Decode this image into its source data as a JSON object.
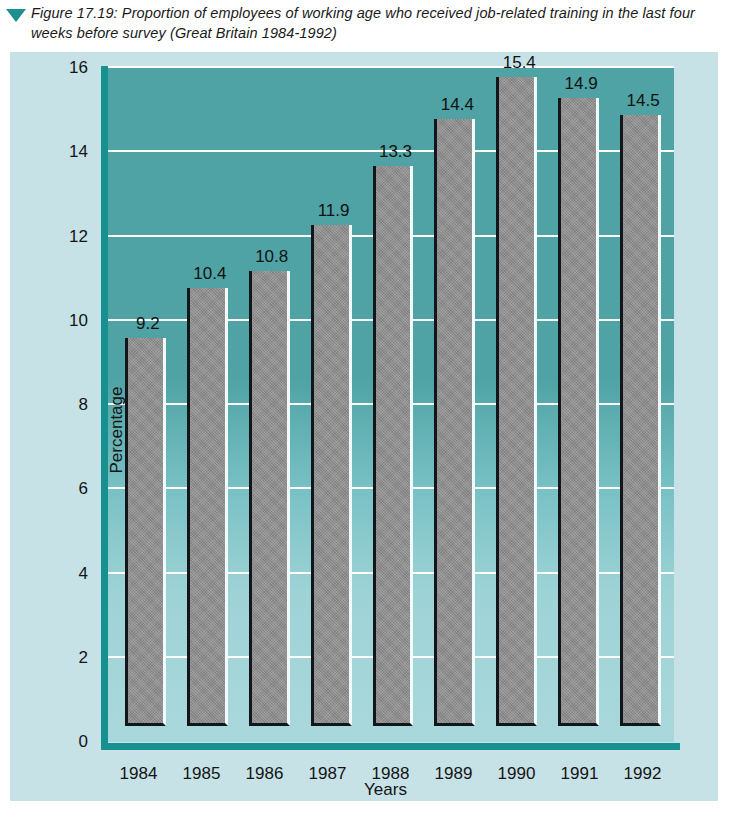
{
  "caption": {
    "marker_icon": "triangle-down-icon",
    "text": "Figure 17.19: Proportion of employees of working age who received job-related training in the last four weeks before survey (Great Britain 1984-1992)"
  },
  "colors": {
    "page_background": "#ffffff",
    "panel_background": "#c6e2e6",
    "plot_top": "#4fa3a4",
    "plot_bottom": "#a9d8dc",
    "axis": "#17918f",
    "gridline": "#ffffff",
    "bar_fill": "#8e8e8e",
    "bar_shadow": "#12161a",
    "bar_highlight": "#f2fbfb",
    "marker": "#1d8f8f",
    "text": "#141414"
  },
  "chart_data": {
    "type": "bar",
    "title": "Figure 17.19: Proportion of employees of working age who received job-related training in the last four weeks before survey (Great Britain 1984-1992)",
    "categories": [
      "1984",
      "1985",
      "1986",
      "1987",
      "1988",
      "1989",
      "1990",
      "1991",
      "1992"
    ],
    "values": [
      9.2,
      10.4,
      10.8,
      11.9,
      13.3,
      14.4,
      15.4,
      14.9,
      14.5
    ],
    "value_labels": [
      "9.2",
      "10.4",
      "10.8",
      "11.9",
      "13.3",
      "14.4",
      "15.4",
      "14.9",
      "14.5"
    ],
    "xlabel": "Years",
    "ylabel": "Percentage",
    "ylim": [
      0,
      16
    ],
    "yticks": [
      0,
      2,
      4,
      6,
      8,
      10,
      12,
      14,
      16
    ],
    "ytick_labels": [
      "0",
      "2",
      "4",
      "6",
      "8",
      "10",
      "12",
      "14",
      "16"
    ],
    "grid": true,
    "legend": false
  }
}
